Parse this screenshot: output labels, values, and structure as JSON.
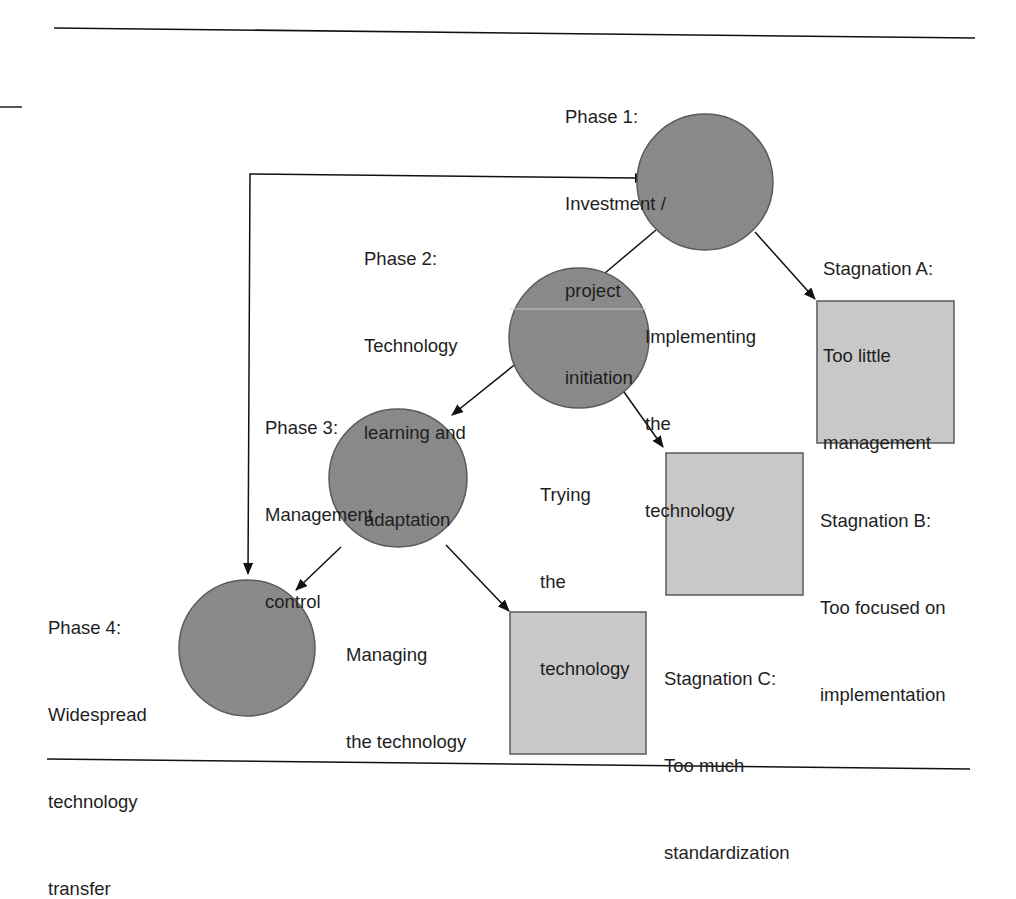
{
  "colors": {
    "circle_fill": "#8a8a8a",
    "square_fill": "#c9c9c9",
    "stroke": "#5a5a5a",
    "line": "#111111"
  },
  "phases": [
    {
      "id": "phase1",
      "title": "Phase 1:",
      "lines": [
        "Investment /",
        "project",
        "initiation"
      ]
    },
    {
      "id": "phase2",
      "title": "Phase 2:",
      "lines": [
        "Technology",
        "learning and",
        "adaptation"
      ]
    },
    {
      "id": "phase3",
      "title": "Phase 3:",
      "lines": [
        "Management",
        "control"
      ]
    },
    {
      "id": "phase4",
      "title": "Phase 4:",
      "lines": [
        "Widespread",
        "technology",
        "transfer"
      ]
    }
  ],
  "transitions": [
    {
      "from": "phase1",
      "to": "phase2",
      "label": [
        "Implementing",
        "the",
        "technology"
      ]
    },
    {
      "from": "phase2",
      "to": "phase3",
      "label": [
        "Trying",
        "the",
        "technology"
      ]
    },
    {
      "from": "phase3",
      "to": "phase4",
      "label": [
        "Managing",
        "the technology"
      ]
    }
  ],
  "stagnations": [
    {
      "id": "stagA",
      "title": "Stagnation A:",
      "lines": [
        "Too little",
        "management"
      ]
    },
    {
      "id": "stagB",
      "title": "Stagnation B:",
      "lines": [
        "Too focused on",
        "implementation"
      ]
    },
    {
      "id": "stagC",
      "title": "Stagnation C:",
      "lines": [
        "Too much",
        "standardization"
      ]
    }
  ],
  "feedback": {
    "from": "phase1",
    "to": "phase4",
    "type": "bidirectional-arrow"
  }
}
